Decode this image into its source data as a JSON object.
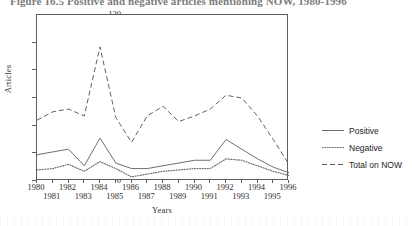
{
  "figure": {
    "title": "Figure 16.5   Positive and negative articles mentioning NOW, 1980-1996"
  },
  "chart_data": {
    "type": "line",
    "title": "Figure 16.5   Positive and negative articles mentioning NOW, 1980-1996",
    "xlabel": "Years",
    "ylabel": "Articles",
    "xlim": [
      1980,
      1996
    ],
    "ylim": [
      0,
      120
    ],
    "yticks": [
      0,
      20,
      40,
      60,
      80,
      100,
      120
    ],
    "xticks": [
      1980,
      1981,
      1982,
      1983,
      1984,
      1985,
      1986,
      1987,
      1988,
      1989,
      1990,
      1991,
      1992,
      1993,
      1994,
      1995,
      1996
    ],
    "xtick_labels_even": [
      "1980",
      "1982",
      "1984",
      "1986",
      "1988",
      "1990",
      "1992",
      "1994",
      "1996"
    ],
    "xtick_labels_odd": [
      "1981",
      "1983",
      "1985",
      "1987",
      "1989",
      "1991",
      "1993",
      "1995"
    ],
    "grid": false,
    "legend_position": "right",
    "x": [
      1980,
      1981,
      1982,
      1983,
      1984,
      1985,
      1986,
      1987,
      1988,
      1989,
      1990,
      1991,
      1992,
      1993,
      1994,
      1995,
      1996
    ],
    "series": [
      {
        "name": "Positive",
        "style": "solid",
        "color": "#707070",
        "values": [
          19,
          21,
          23,
          11,
          31,
          13,
          9,
          9,
          11,
          13,
          15,
          15,
          30,
          23,
          16,
          10,
          6
        ]
      },
      {
        "name": "Negative",
        "style": "dotted",
        "color": "#707070",
        "values": [
          8,
          9,
          12,
          7,
          14,
          9,
          3,
          5,
          7,
          8,
          9,
          9,
          16,
          15,
          11,
          7,
          4
        ]
      },
      {
        "name": "Total on NOW",
        "style": "dashed",
        "color": "#606060",
        "values": [
          44,
          50,
          52,
          47,
          97,
          46,
          28,
          47,
          54,
          43,
          47,
          52,
          62,
          60,
          47,
          30,
          12
        ]
      }
    ]
  },
  "legend": {
    "items": [
      {
        "label": "Positive",
        "style": "solid"
      },
      {
        "label": "Negative",
        "style": "dotted"
      },
      {
        "label": "Total on NOW",
        "style": "dashed"
      }
    ]
  }
}
